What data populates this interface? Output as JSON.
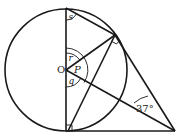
{
  "diagram": {
    "type": "circle-geometry",
    "labels": {
      "center": "O",
      "angle_s": "s",
      "angle_r": "r",
      "angle_p": "P",
      "angle_q": "q",
      "given_angle": "37°"
    },
    "colors": {
      "stroke": "#1a1a1a",
      "background": "#ffffff"
    }
  }
}
